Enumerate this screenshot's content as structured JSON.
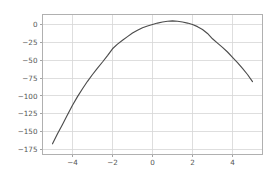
{
  "chart_data": {
    "type": "line",
    "title": "",
    "xlabel": "",
    "ylabel": "",
    "xlim": [
      -5.5,
      5.5
    ],
    "ylim": [
      -182,
      14
    ],
    "grid": true,
    "legend": null,
    "legend_position": "none",
    "line_color": "#4c4c4c",
    "grid_color": "#d6d6d6",
    "border_color": "#b0b0b0",
    "tick_label_color": "#555555",
    "background_color": "#ffffff",
    "xticks": [
      -4,
      -2,
      0,
      2,
      4
    ],
    "xtick_labels": [
      "−4",
      "−2",
      "0",
      "2",
      "4"
    ],
    "yticks": [
      0,
      -25,
      -50,
      -75,
      -100,
      -125,
      -150,
      -175
    ],
    "ytick_labels": [
      "0",
      "−25",
      "−50",
      "−75",
      "−100",
      "−125",
      "−150",
      "−175"
    ],
    "series": [
      {
        "name": "curve",
        "x": [
          -5.0,
          -4.75,
          -4.5,
          -4.25,
          -4.0,
          -3.75,
          -3.5,
          -3.25,
          -3.0,
          -2.75,
          -2.5,
          -2.25,
          -2.0,
          -1.75,
          -1.5,
          -1.25,
          -1.0,
          -0.75,
          -0.5,
          -0.25,
          0.0,
          0.25,
          0.5,
          0.75,
          1.0,
          1.25,
          1.5,
          1.75,
          2.0,
          2.25,
          2.5,
          2.75,
          3.0,
          3.25,
          3.5,
          3.75,
          4.0,
          4.25,
          4.5,
          4.75,
          5.0
        ],
        "y": [
          -167.0,
          -153.0,
          -140.0,
          -126.5,
          -113.0,
          -101.0,
          -90.0,
          -79.5,
          -70.0,
          -61.0,
          -52.5,
          -43.5,
          -34.0,
          -27.5,
          -22.0,
          -17.0,
          -12.0,
          -8.0,
          -4.5,
          -2.0,
          0.0,
          2.0,
          3.5,
          4.5,
          5.0,
          4.5,
          3.5,
          2.0,
          0.0,
          -3.0,
          -7.0,
          -12.5,
          -20.0,
          -26.0,
          -32.0,
          -38.5,
          -46.0,
          -53.5,
          -61.5,
          -70.0,
          -80.0
        ]
      }
    ]
  }
}
